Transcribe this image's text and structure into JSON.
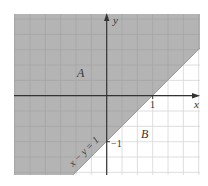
{
  "diagram": {
    "type": "inequality-region-plot",
    "plot": {
      "left": 14,
      "top": 14,
      "right": 200,
      "bottom": 175,
      "origin_px": [
        106.7,
        95.7
      ],
      "unit_px": 46,
      "grid_step_px": 15.33,
      "xrange": [
        -2,
        2
      ],
      "yrange": [
        -1.72,
        1.78
      ]
    },
    "colors": {
      "shaded_region": "#b4b4b4",
      "grid_in_shaded": "#a4a4a4",
      "grid_in_white": "#d6d6d6",
      "axis": "#333333",
      "background": "#ffffff"
    },
    "axes": {
      "x_label": "x",
      "y_label": "y"
    },
    "ticks": {
      "x_one": "1",
      "y_minus_one": "−1"
    },
    "line": {
      "equation": "x − y = 1",
      "label": "x − y = 1"
    },
    "regions": {
      "A": {
        "label": "A",
        "description": "shaded, above line (x − y < 1)"
      },
      "B": {
        "label": "B",
        "description": "unshaded, below line (x − y > 1)"
      }
    }
  }
}
